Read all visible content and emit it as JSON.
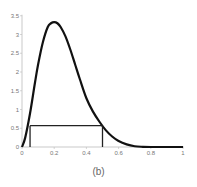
{
  "chart_data": {
    "type": "line",
    "title": "",
    "caption": "(b)",
    "xlabel": "",
    "ylabel": "",
    "xlim": [
      0,
      1
    ],
    "ylim": [
      0,
      3.5
    ],
    "x_ticks": [
      0,
      0.2,
      0.4,
      0.6,
      0.8,
      1
    ],
    "x_tick_labels": [
      "0",
      "0.2",
      "0.4",
      "0.6",
      "0.8",
      "1"
    ],
    "y_ticks": [
      0,
      0.5,
      1,
      1.5,
      2,
      2.5,
      3,
      3.5
    ],
    "y_tick_labels": [
      "0",
      "0.5",
      "1",
      "1.5",
      "2",
      "2.5",
      "3",
      "3.5"
    ],
    "grid": false,
    "legend": null,
    "series": [
      {
        "name": "density",
        "color": "#111111",
        "x": [
          0,
          0.02,
          0.05,
          0.08,
          0.1,
          0.13,
          0.16,
          0.18,
          0.2,
          0.22,
          0.24,
          0.27,
          0.3,
          0.33,
          0.36,
          0.4,
          0.44,
          0.48,
          0.52,
          0.56,
          0.6,
          0.65,
          0.7,
          0.75,
          0.8,
          0.9,
          1
        ],
        "values": [
          0,
          0.25,
          0.9,
          1.7,
          2.2,
          2.8,
          3.2,
          3.3,
          3.33,
          3.3,
          3.2,
          2.95,
          2.6,
          2.2,
          1.8,
          1.3,
          0.95,
          0.68,
          0.45,
          0.28,
          0.16,
          0.07,
          0.02,
          0.005,
          0,
          0,
          0
        ]
      }
    ],
    "annotations": {
      "horizontal_line": {
        "y": 0.57,
        "x_from": 0.05,
        "x_to": 0.5
      },
      "vertical_lines": [
        {
          "x": 0.05,
          "y_from": 0,
          "y_to": 0.57
        },
        {
          "x": 0.5,
          "y_from": 0,
          "y_to": 0.57
        }
      ]
    }
  }
}
